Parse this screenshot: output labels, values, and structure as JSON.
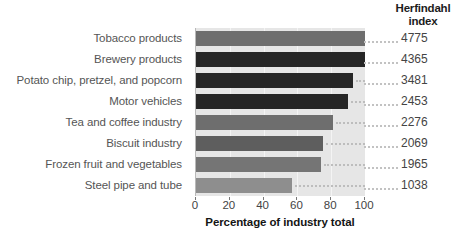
{
  "header": {
    "right_column_title_line1": "Herfindahl",
    "right_column_title_line2": "index"
  },
  "axis": {
    "ticks": [
      "0",
      "20",
      "40",
      "60",
      "80",
      "100"
    ],
    "title": "Percentage of industry total"
  },
  "chart_data": {
    "type": "bar",
    "orientation": "horizontal",
    "title": "",
    "xlabel": "Percentage of industry total",
    "ylabel": "",
    "xlim": [
      0,
      100
    ],
    "grid": true,
    "legend": false,
    "categories": [
      "Tobacco products",
      "Brewery products",
      "Potato chip, pretzel, and popcorn",
      "Motor vehicles",
      "Tea and coffee industry",
      "Biscuit industry",
      "Frozen fruit and vegetables",
      "Steel pipe and tube"
    ],
    "values": [
      100,
      100,
      93,
      90,
      81,
      75,
      74,
      57
    ],
    "bar_colors": [
      "#6e6e6e",
      "#262626",
      "#262626",
      "#262626",
      "#6e6e6e",
      "#5e5e5e",
      "#757575",
      "#8e8e8e"
    ],
    "annotations": {
      "label": "Herfindahl index",
      "values": [
        4775,
        4365,
        3481,
        2453,
        2276,
        2069,
        1965,
        1038
      ]
    }
  }
}
